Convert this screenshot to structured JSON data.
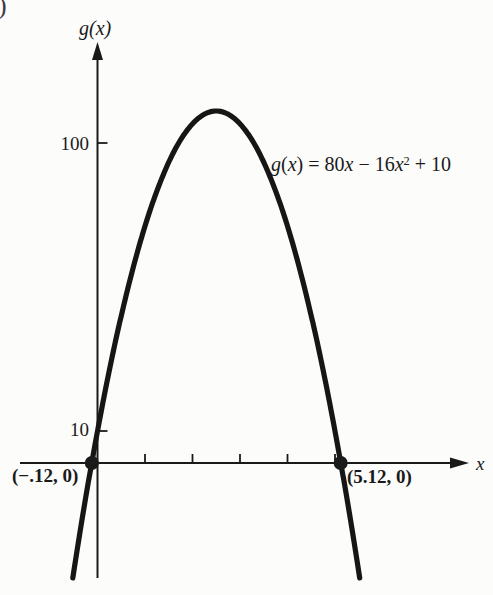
{
  "page": {
    "corner_fragment": ")"
  },
  "equation": {
    "full": "g(x) = 80x − 16x² + 10",
    "parts": [
      {
        "text": "g",
        "style": "var"
      },
      {
        "text": "(",
        "style": "num"
      },
      {
        "text": "x",
        "style": "var"
      },
      {
        "text": ") = 80",
        "style": "num"
      },
      {
        "text": "x",
        "style": "var"
      },
      {
        "text": " − 16",
        "style": "num"
      },
      {
        "text": "x",
        "style": "var"
      },
      {
        "text": "2",
        "style": "sup"
      },
      {
        "text": " + 10",
        "style": "num"
      }
    ]
  },
  "chart_data": {
    "type": "line",
    "function_label": "g(x) = 80x − 16x² + 10",
    "coefficients": {
      "x2": -16,
      "x1": 80,
      "x0": 10
    },
    "xlabel": "x",
    "ylabel": "g(x)",
    "x_intercepts": [
      {
        "x": -0.12,
        "y": 0,
        "label": "(−.12, 0)"
      },
      {
        "x": 5.12,
        "y": 0,
        "label": "(5.12, 0)"
      }
    ],
    "y_intercept": {
      "x": 0,
      "y": 10
    },
    "vertex": {
      "x": 2.5,
      "y": 110
    },
    "y_tick_values": [
      100,
      10
    ],
    "y_tick_labels": [
      "100",
      "10"
    ],
    "x_tick_values": [
      1,
      2,
      3,
      4,
      5
    ],
    "x_tick_labels": [
      "",
      "",
      "",
      "",
      ""
    ],
    "x_range_drawn": [
      -0.52,
      5.52
    ],
    "grid": false,
    "legend": false,
    "ink_color": "#1a1a1a"
  }
}
